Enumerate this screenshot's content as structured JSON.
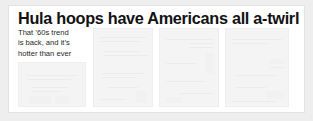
{
  "page": {
    "background_color": "#eeeeee",
    "card_background_color": "#ffffff"
  },
  "article": {
    "headline": "Hula hoops have Americans all a-twirl",
    "deck_lines": [
      "That ’60s trend",
      "is back, and it’s",
      "hotter than ever"
    ],
    "text_color": "#121212"
  },
  "photos": [
    {
      "name": "photo-placeholder-1",
      "fill": "#f4f4f4"
    },
    {
      "name": "photo-placeholder-2",
      "fill": "#f4f4f4"
    },
    {
      "name": "photo-placeholder-3",
      "fill": "#f4f4f4"
    },
    {
      "name": "photo-placeholder-4",
      "fill": "#f4f4f4"
    }
  ]
}
